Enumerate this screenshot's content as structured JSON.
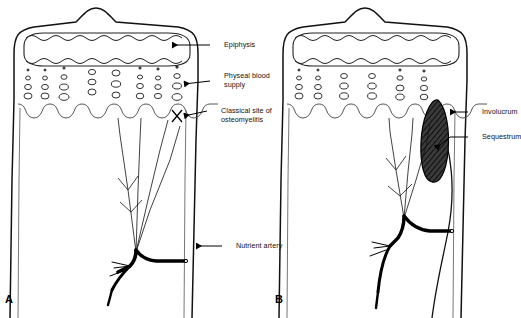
{
  "figure": {
    "background": "#ffffff",
    "ink": "#000000",
    "panels": [
      {
        "letter": "A",
        "description": "Normal growing long bone end showing epiphysis, physeal blood supply and nutrient artery",
        "labels": [
          {
            "text": "Epiphysis",
            "target": "epiphysis"
          },
          {
            "text": "Physeal blood supply",
            "target": "physeal-blood-supply"
          },
          {
            "text": "Classical site of osteomyelitis",
            "target": "classical-site-osteomyelitis"
          },
          {
            "text": "Nutrient artery",
            "target": "nutrient-artery"
          }
        ]
      },
      {
        "letter": "B",
        "description": "Same bone with osteomyelitis showing sequestrum and involucrum",
        "labels": [
          {
            "text": "Involucrum",
            "target": "involucrum"
          },
          {
            "text": "Sequestrum",
            "target": "sequestrum"
          }
        ]
      }
    ],
    "caption": ""
  }
}
